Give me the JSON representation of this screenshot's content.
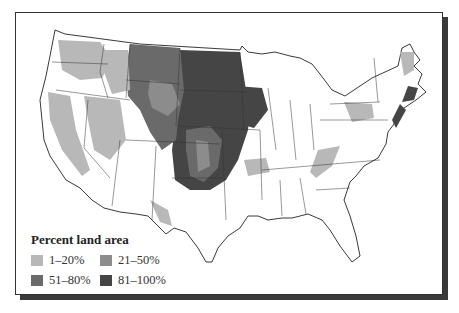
{
  "legend": {
    "title": "Percent land area",
    "items": [
      {
        "label": "1–20%",
        "color": "#b8b8b8"
      },
      {
        "label": "21–50%",
        "color": "#8c8c8c"
      },
      {
        "label": "51–80%",
        "color": "#6a6a6a"
      },
      {
        "label": "81–100%",
        "color": "#454545"
      }
    ]
  },
  "map": {
    "subject": "Contiguous United States",
    "fill_classes": [
      "1–20%",
      "21–50%",
      "51–80%",
      "81–100%"
    ]
  }
}
